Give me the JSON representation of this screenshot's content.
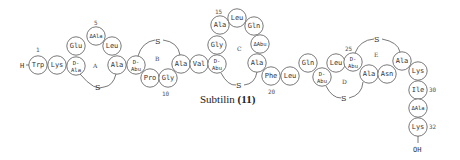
{
  "caption": {
    "name": "Subtilin",
    "compound_number": "(11)"
  },
  "termini": {
    "n_terminus": "H",
    "c_terminus": "OH"
  },
  "ring_labels": [
    "A",
    "B",
    "C",
    "D",
    "E"
  ],
  "sulfur_label": "S",
  "position_numbers": [
    "1",
    "5",
    "10",
    "15",
    "20",
    "25",
    "30",
    "32"
  ],
  "residues": [
    {
      "pos": 1,
      "label": "Trp",
      "x": 38,
      "y": 65
    },
    {
      "pos": 2,
      "label": "Lys",
      "x": 57,
      "y": 65
    },
    {
      "pos": 3,
      "label": "D-\nAla",
      "x": 76,
      "y": 66
    },
    {
      "pos": 4,
      "label": "Glu",
      "x": 76,
      "y": 46
    },
    {
      "pos": 5,
      "label": "ΔAla",
      "x": 96,
      "y": 36
    },
    {
      "pos": 6,
      "label": "Leu",
      "x": 112,
      "y": 46
    },
    {
      "pos": 7,
      "label": "Ala",
      "x": 117,
      "y": 65
    },
    {
      "pos": 8,
      "label": "D-\nAbu",
      "x": 136,
      "y": 65
    },
    {
      "pos": 9,
      "label": "Pro",
      "x": 150,
      "y": 78
    },
    {
      "pos": 10,
      "label": "Gly",
      "x": 168,
      "y": 78
    },
    {
      "pos": 11,
      "label": "Ala",
      "x": 181,
      "y": 64
    },
    {
      "pos": 12,
      "label": "Val",
      "x": 199,
      "y": 64
    },
    {
      "pos": 13,
      "label": "D-\nAbu",
      "x": 217,
      "y": 64
    },
    {
      "pos": 14,
      "label": "Gly",
      "x": 217,
      "y": 45
    },
    {
      "pos": 15,
      "label": "Ala",
      "x": 220,
      "y": 25
    },
    {
      "pos": 16,
      "label": "Leu",
      "x": 237,
      "y": 18
    },
    {
      "pos": 17,
      "label": "Gln",
      "x": 254,
      "y": 26
    },
    {
      "pos": 18,
      "label": "ΔAbu",
      "x": 260,
      "y": 44
    },
    {
      "pos": 19,
      "label": "Ala",
      "x": 257,
      "y": 63
    },
    {
      "pos": 20,
      "label": "Phe",
      "x": 271,
      "y": 76
    },
    {
      "pos": 21,
      "label": "Leu",
      "x": 290,
      "y": 76
    },
    {
      "pos": 22,
      "label": "Gln",
      "x": 308,
      "y": 63
    },
    {
      "pos": 23,
      "label": "D-\nAbu",
      "x": 322,
      "y": 77
    },
    {
      "pos": 24,
      "label": "Leu",
      "x": 336,
      "y": 63
    },
    {
      "pos": 25,
      "label": "D-\nAbu",
      "x": 353,
      "y": 62
    },
    {
      "pos": 26,
      "label": "Ala",
      "x": 369,
      "y": 74
    },
    {
      "pos": 27,
      "label": "Asn",
      "x": 387,
      "y": 74
    },
    {
      "pos": 28,
      "label": "Ala",
      "x": 402,
      "y": 61
    },
    {
      "pos": 29,
      "label": "Lys",
      "x": 418,
      "y": 71
    },
    {
      "pos": 30,
      "label": "Ile",
      "x": 418,
      "y": 90
    },
    {
      "pos": 31,
      "label": "ΔAla",
      "x": 418,
      "y": 108
    },
    {
      "pos": 32,
      "label": "Lys",
      "x": 418,
      "y": 127
    }
  ]
}
